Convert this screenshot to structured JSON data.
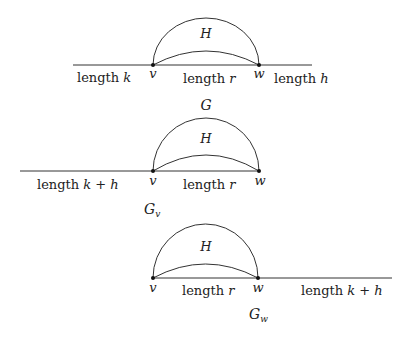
{
  "diagrams": [
    {
      "id": "G",
      "caption": "G",
      "caption_sub": "",
      "subgraph_label": "H",
      "vertex_v": "v",
      "vertex_w": "w",
      "segments": [
        {
          "position": "left",
          "label_prefix": "length ",
          "label_var": "k"
        },
        {
          "position": "middle",
          "label_prefix": "length ",
          "label_var": "r"
        },
        {
          "position": "right",
          "label_prefix": "length ",
          "label_var": "h"
        }
      ]
    },
    {
      "id": "G_v",
      "caption": "G",
      "caption_sub": "v",
      "subgraph_label": "H",
      "vertex_v": "v",
      "vertex_w": "w",
      "segments": [
        {
          "position": "left",
          "label_prefix": "length ",
          "label_var": "k + h"
        },
        {
          "position": "middle",
          "label_prefix": "length ",
          "label_var": "r"
        }
      ]
    },
    {
      "id": "G_w",
      "caption": "G",
      "caption_sub": "w",
      "subgraph_label": "H",
      "vertex_v": "v",
      "vertex_w": "w",
      "segments": [
        {
          "position": "middle",
          "label_prefix": "length ",
          "label_var": "r"
        },
        {
          "position": "right",
          "label_prefix": "length ",
          "label_var": "k + h"
        }
      ]
    }
  ]
}
